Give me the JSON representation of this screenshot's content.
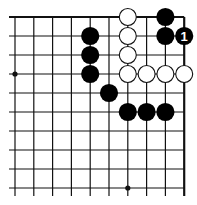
{
  "diagram": {
    "type": "go-board-fragment",
    "grid": {
      "columns": 10,
      "rows": 10,
      "origin_x": 15,
      "origin_y": 17,
      "step_x": 18.8,
      "step_y": 19.0,
      "edges": {
        "top": true,
        "right": true,
        "bottom": false,
        "left": false
      },
      "line_color": "#111111",
      "edge_width": 2.2,
      "line_width": 1.2
    },
    "star_points": [
      {
        "col": 0,
        "row": 3
      },
      {
        "col": 6,
        "row": 9
      }
    ],
    "stones": [
      {
        "color": "black",
        "col": 4,
        "row": 1
      },
      {
        "color": "black",
        "col": 4,
        "row": 2
      },
      {
        "color": "black",
        "col": 4,
        "row": 3
      },
      {
        "color": "black",
        "col": 5,
        "row": 4
      },
      {
        "color": "black",
        "col": 6,
        "row": 5
      },
      {
        "color": "black",
        "col": 7,
        "row": 5
      },
      {
        "color": "black",
        "col": 8,
        "row": 5
      },
      {
        "color": "black",
        "col": 8,
        "row": 0
      },
      {
        "color": "black",
        "col": 8,
        "row": 1
      },
      {
        "color": "black",
        "col": 9,
        "row": 1,
        "label": "1"
      },
      {
        "color": "white",
        "col": 6,
        "row": 0
      },
      {
        "color": "white",
        "col": 6,
        "row": 1
      },
      {
        "color": "white",
        "col": 6,
        "row": 2
      },
      {
        "color": "white",
        "col": 6,
        "row": 3
      },
      {
        "color": "white",
        "col": 7,
        "row": 3
      },
      {
        "color": "white",
        "col": 8,
        "row": 3
      },
      {
        "color": "white",
        "col": 9,
        "row": 3
      }
    ],
    "colors": {
      "black_stone": "#000000",
      "white_stone": "#ffffff",
      "white_stone_border": "#111111",
      "label_on_black": "#ffffff",
      "background": "#ffffff"
    }
  }
}
